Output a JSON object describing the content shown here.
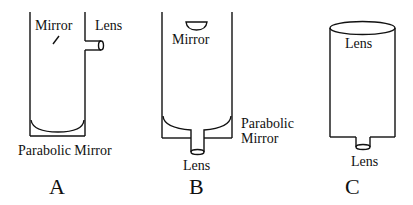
{
  "diagram": {
    "panels": [
      {
        "id": "A",
        "caption": "A",
        "labels": {
          "mirror": "Mirror",
          "lens": "Lens",
          "parabolic_mirror": "Parabolic Mirror"
        }
      },
      {
        "id": "B",
        "caption": "B",
        "labels": {
          "mirror": "Mirror",
          "lens": "Lens",
          "parabolic_mirror_line1": "Parabolic",
          "parabolic_mirror_line2": "Mirror"
        }
      },
      {
        "id": "C",
        "caption": "C",
        "labels": {
          "top_lens": "Lens",
          "bottom_lens": "Lens"
        }
      }
    ],
    "colors": {
      "line": "#111111",
      "background": "#ffffff"
    }
  }
}
